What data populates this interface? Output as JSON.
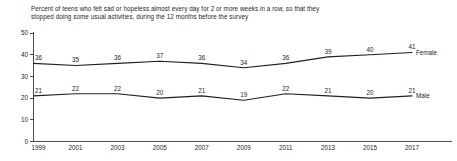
{
  "chart_data": {
    "type": "line",
    "title": "Percent of teens who felt sad or hopeless almost every day for 2 or more weeks in a row, so that they stopped doing some usual activities, during the 12 months before the survey",
    "xlabel": "",
    "ylabel": "",
    "x": [
      1999,
      2001,
      2003,
      2005,
      2007,
      2009,
      2011,
      2013,
      2015,
      2017
    ],
    "categories": [
      "1999",
      "2001",
      "2003",
      "2005",
      "2007",
      "2009",
      "2011",
      "2013",
      "2015",
      "2017"
    ],
    "xlim": [
      1999,
      2017
    ],
    "ylim": [
      0,
      50
    ],
    "yticks": [
      0,
      10,
      20,
      30,
      40,
      50
    ],
    "ytick_labels": [
      "0",
      "10",
      "20",
      "30",
      "40",
      "50"
    ],
    "xtick_labels": [
      "1999",
      "2001",
      "2003",
      "2005",
      "2007",
      "2009",
      "2011",
      "2013",
      "2015",
      "2017"
    ],
    "grid": false,
    "legend_position": "right-inline",
    "series": [
      {
        "name": "Female",
        "values": [
          36,
          35,
          36,
          37,
          36,
          34,
          36,
          39,
          40,
          41
        ],
        "labels": [
          "36",
          "35",
          "36",
          "37",
          "36",
          "34",
          "36",
          "39",
          "40",
          "41"
        ],
        "color": "#231f20"
      },
      {
        "name": "Male",
        "values": [
          21,
          22,
          22,
          20,
          21,
          19,
          22,
          21,
          20,
          21
        ],
        "labels": [
          "21",
          "22",
          "22",
          "20",
          "21",
          "19",
          "22",
          "21",
          "20",
          "21"
        ],
        "color": "#231f20"
      }
    ]
  },
  "colors": {
    "ink": "#231f20",
    "background": "#ffffff"
  }
}
